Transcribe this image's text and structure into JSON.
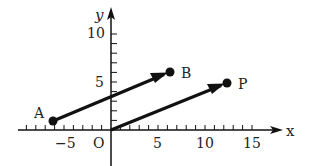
{
  "diagram": {
    "type": "coordinate-plane-vectors",
    "axes": {
      "x_label": "x",
      "y_label": "y",
      "origin_label": "O",
      "x_tick_labels": [
        "−5",
        "5",
        "10",
        "15"
      ],
      "y_tick_labels": [
        "5",
        "10"
      ],
      "x_range": [
        -8,
        17
      ],
      "y_range": [
        -1,
        11
      ]
    },
    "points": [
      {
        "label": "A",
        "x": -6,
        "y": 1
      },
      {
        "label": "B",
        "x": 6,
        "y": 6
      },
      {
        "label": "P",
        "x": 12,
        "y": 5
      }
    ],
    "vectors": [
      {
        "from": "A",
        "to": "B",
        "components": [
          12,
          5
        ]
      },
      {
        "from": "O",
        "to": "P",
        "components": [
          12,
          5
        ]
      }
    ],
    "colors": {
      "ink": "#111111",
      "background": "#ffffff"
    }
  }
}
